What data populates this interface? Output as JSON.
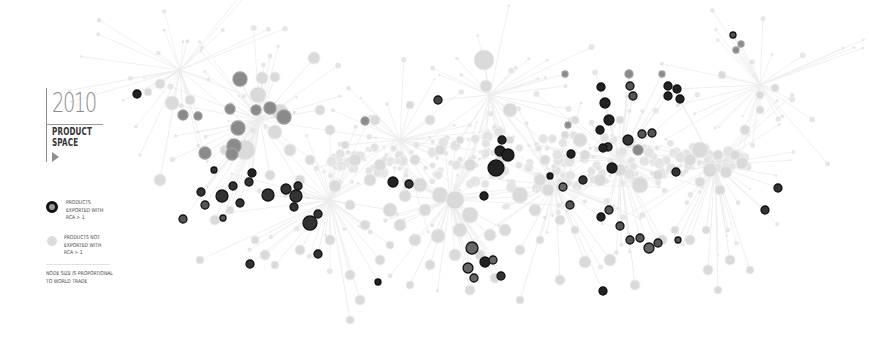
{
  "legend": {
    "year": "2010",
    "title_line1": "PRODUCT",
    "title_line2": "SPACE",
    "play_icon": "play-icon",
    "items": [
      {
        "label": "PRODUCTS\nEXPORTED WITH\nRCA > 1",
        "style": "rca"
      },
      {
        "label": "PRODUCTS NOT\nEXPORTED WITH\nRCA > 1",
        "style": "not-rca"
      }
    ],
    "footnote": "NODE SIZE IS PROPORTIONAL\nTO WORLD TRADE"
  },
  "colors": {
    "background": "#ffffff",
    "edge": "#ececec",
    "node_not_rca": "#dadada",
    "node_rca_dark": "#222222",
    "node_rca_mid": "#555555",
    "node_rca_light": "#8a8a8a"
  },
  "network": {
    "hubs": [
      [
        260,
        120
      ],
      [
        330,
        200
      ],
      [
        450,
        200
      ],
      [
        555,
        185
      ],
      [
        620,
        160
      ],
      [
        715,
        165
      ],
      [
        760,
        85
      ],
      [
        490,
        95
      ],
      [
        180,
        70
      ],
      [
        400,
        140
      ]
    ],
    "nodes_not_rca": [
      [
        484,
        60,
        10
      ],
      [
        486,
        86,
        6
      ],
      [
        510,
        110,
        7
      ],
      [
        314,
        58,
        6
      ],
      [
        240,
        80,
        7
      ],
      [
        262,
        78,
        6
      ],
      [
        275,
        77,
        5
      ],
      [
        258,
        95,
        8
      ],
      [
        280,
        112,
        8
      ],
      [
        245,
        150,
        10
      ],
      [
        275,
        132,
        7
      ],
      [
        290,
        150,
        6
      ],
      [
        172,
        103,
        7
      ],
      [
        160,
        84,
        5
      ],
      [
        148,
        92,
        4
      ],
      [
        160,
        180,
        6
      ],
      [
        190,
        100,
        5
      ],
      [
        225,
        150,
        5
      ],
      [
        270,
        175,
        5
      ],
      [
        300,
        180,
        5
      ],
      [
        335,
        186,
        6
      ],
      [
        355,
        160,
        6
      ],
      [
        375,
        120,
        5
      ],
      [
        380,
        165,
        6
      ],
      [
        390,
        210,
        7
      ],
      [
        405,
        196,
        6
      ],
      [
        420,
        185,
        7
      ],
      [
        425,
        210,
        6
      ],
      [
        440,
        195,
        8
      ],
      [
        455,
        200,
        9
      ],
      [
        470,
        215,
        8
      ],
      [
        460,
        230,
        7
      ],
      [
        438,
        236,
        7
      ],
      [
        415,
        240,
        6
      ],
      [
        400,
        225,
        6
      ],
      [
        365,
        225,
        5
      ],
      [
        350,
        205,
        5
      ],
      [
        520,
        195,
        8
      ],
      [
        540,
        180,
        6
      ],
      [
        548,
        190,
        6
      ],
      [
        535,
        210,
        6
      ],
      [
        505,
        230,
        6
      ],
      [
        520,
        250,
        5
      ],
      [
        490,
        235,
        6
      ],
      [
        480,
        255,
        5
      ],
      [
        545,
        160,
        5
      ],
      [
        580,
        140,
        7
      ],
      [
        600,
        180,
        6
      ],
      [
        620,
        170,
        6
      ],
      [
        640,
        185,
        8
      ],
      [
        658,
        175,
        5
      ],
      [
        690,
        160,
        6
      ],
      [
        700,
        150,
        8
      ],
      [
        710,
        170,
        7
      ],
      [
        718,
        155,
        5
      ],
      [
        726,
        172,
        6
      ],
      [
        735,
        155,
        5
      ],
      [
        742,
        163,
        6
      ],
      [
        700,
        182,
        5
      ],
      [
        720,
        190,
        5
      ],
      [
        610,
        260,
        6
      ],
      [
        635,
        285,
        5
      ],
      [
        662,
        240,
        5
      ],
      [
        675,
        230,
        4
      ],
      [
        690,
        240,
        5
      ],
      [
        706,
        230,
        4
      ],
      [
        730,
        260,
        5
      ],
      [
        750,
        270,
        4
      ],
      [
        708,
        270,
        5
      ],
      [
        718,
        290,
        4
      ],
      [
        760,
        95,
        4
      ],
      [
        775,
        88,
        4
      ],
      [
        745,
        130,
        5
      ],
      [
        760,
        110,
        4
      ],
      [
        722,
        75,
        4
      ],
      [
        300,
        250,
        5
      ],
      [
        330,
        240,
        5
      ],
      [
        350,
        275,
        5
      ],
      [
        380,
        260,
        5
      ],
      [
        410,
        285,
        4
      ],
      [
        430,
        265,
        5
      ],
      [
        455,
        255,
        6
      ],
      [
        470,
        290,
        5
      ],
      [
        495,
        278,
        5
      ],
      [
        520,
        300,
        4
      ],
      [
        560,
        280,
        5
      ],
      [
        585,
        262,
        6
      ],
      [
        200,
        260,
        4
      ],
      [
        215,
        220,
        5
      ],
      [
        230,
        210,
        4
      ],
      [
        255,
        240,
        4
      ],
      [
        265,
        255,
        5
      ],
      [
        275,
        265,
        4
      ],
      [
        575,
        120,
        4
      ],
      [
        565,
        135,
        4
      ],
      [
        585,
        155,
        5
      ],
      [
        620,
        120,
        4
      ],
      [
        600,
        130,
        4
      ],
      [
        415,
        160,
        5
      ],
      [
        440,
        150,
        5
      ],
      [
        460,
        140,
        4
      ],
      [
        470,
        165,
        6
      ],
      [
        500,
        160,
        5
      ],
      [
        510,
        140,
        4
      ],
      [
        430,
        120,
        5
      ],
      [
        410,
        105,
        4
      ],
      [
        320,
        110,
        5
      ],
      [
        330,
        130,
        5
      ],
      [
        345,
        145,
        4
      ],
      [
        310,
        160,
        5
      ],
      [
        370,
        180,
        6
      ],
      [
        390,
        245,
        4
      ],
      [
        360,
        300,
        5
      ],
      [
        350,
        320,
        4
      ],
      [
        540,
        240,
        4
      ],
      [
        560,
        220,
        5
      ],
      [
        575,
        230,
        4
      ]
    ],
    "nodes_rca": [
      [
        137,
        94,
        4,
        "#222"
      ],
      [
        240,
        79,
        7,
        "#8a8a8a"
      ],
      [
        256,
        110,
        5,
        "#8a8a8a"
      ],
      [
        270,
        108,
        6,
        "#8a8a8a"
      ],
      [
        284,
        117,
        7,
        "#8a8a8a"
      ],
      [
        238,
        128,
        7,
        "#8a8a8a"
      ],
      [
        234,
        146,
        7,
        "#8a8a8a"
      ],
      [
        205,
        153,
        6,
        "#8a8a8a"
      ],
      [
        230,
        109,
        5,
        "#8a8a8a"
      ],
      [
        183,
        115,
        5,
        "#8a8a8a"
      ],
      [
        198,
        116,
        4,
        "#8a8a8a"
      ],
      [
        232,
        154,
        6,
        "#8a8a8a"
      ],
      [
        214,
        170,
        3,
        "#333"
      ],
      [
        252,
        173,
        4,
        "#222"
      ],
      [
        249,
        182,
        4,
        "#333"
      ],
      [
        222,
        196,
        6,
        "#333"
      ],
      [
        201,
        192,
        4,
        "#333"
      ],
      [
        233,
        186,
        4,
        "#333"
      ],
      [
        268,
        195,
        6,
        "#333"
      ],
      [
        240,
        203,
        4,
        "#333"
      ],
      [
        286,
        189,
        5,
        "#333"
      ],
      [
        298,
        186,
        4,
        "#333"
      ],
      [
        296,
        196,
        6,
        "#333"
      ],
      [
        294,
        207,
        4,
        "#333"
      ],
      [
        310,
        223,
        7,
        "#333"
      ],
      [
        205,
        205,
        4,
        "#555"
      ],
      [
        223,
        218,
        3,
        "#555"
      ],
      [
        318,
        214,
        4,
        "#333"
      ],
      [
        318,
        254,
        4,
        "#333"
      ],
      [
        250,
        264,
        4,
        "#333"
      ],
      [
        183,
        219,
        4,
        "#555"
      ],
      [
        438,
        100,
        4,
        "#444"
      ],
      [
        409,
        184,
        4,
        "#333"
      ],
      [
        393,
        182,
        5,
        "#222"
      ],
      [
        365,
        121,
        4,
        "#8a8a8a"
      ],
      [
        502,
        140,
        4,
        "#222"
      ],
      [
        500,
        151,
        5,
        "#222"
      ],
      [
        508,
        155,
        6,
        "#222"
      ],
      [
        496,
        168,
        8,
        "#222"
      ],
      [
        484,
        196,
        4,
        "#222"
      ],
      [
        378,
        282,
        3,
        "#222"
      ],
      [
        472,
        248,
        6,
        "#666"
      ],
      [
        468,
        268,
        5,
        "#666"
      ],
      [
        485,
        262,
        5,
        "#222"
      ],
      [
        493,
        260,
        4,
        "#666"
      ],
      [
        474,
        278,
        4,
        "#666"
      ],
      [
        501,
        276,
        4,
        "#333"
      ],
      [
        565,
        74,
        3,
        "#8a8a8a"
      ],
      [
        601,
        87,
        4,
        "#222"
      ],
      [
        605,
        103,
        5,
        "#222"
      ],
      [
        609,
        120,
        5,
        "#222"
      ],
      [
        629,
        74,
        4,
        "#8a8a8a"
      ],
      [
        630,
        86,
        4,
        "#555"
      ],
      [
        633,
        96,
        4,
        "#555"
      ],
      [
        600,
        130,
        4,
        "#222"
      ],
      [
        568,
        125,
        3,
        "#8a8a8a"
      ],
      [
        628,
        140,
        5,
        "#333"
      ],
      [
        642,
        134,
        4,
        "#555"
      ],
      [
        652,
        133,
        4,
        "#555"
      ],
      [
        608,
        147,
        4,
        "#333"
      ],
      [
        571,
        154,
        4,
        "#222"
      ],
      [
        603,
        148,
        4,
        "#222"
      ],
      [
        612,
        168,
        5,
        "#222"
      ],
      [
        638,
        150,
        5,
        "#8a8a8a"
      ],
      [
        668,
        86,
        4,
        "#222"
      ],
      [
        677,
        89,
        4,
        "#222"
      ],
      [
        668,
        96,
        4,
        "#222"
      ],
      [
        680,
        99,
        4,
        "#222"
      ],
      [
        662,
        74,
        3,
        "#8a8a8a"
      ],
      [
        733,
        35,
        3,
        "#555"
      ],
      [
        741,
        44,
        3,
        "#8a8a8a"
      ],
      [
        736,
        50,
        3,
        "#8a8a8a"
      ],
      [
        583,
        180,
        4,
        "#333"
      ],
      [
        563,
        187,
        4,
        "#666"
      ],
      [
        550,
        176,
        3,
        "#222"
      ],
      [
        570,
        205,
        4,
        "#555"
      ],
      [
        601,
        217,
        4,
        "#222"
      ],
      [
        609,
        210,
        4,
        "#555"
      ],
      [
        620,
        226,
        4,
        "#555"
      ],
      [
        630,
        240,
        4,
        "#555"
      ],
      [
        640,
        238,
        4,
        "#555"
      ],
      [
        649,
        248,
        5,
        "#666"
      ],
      [
        658,
        243,
        4,
        "#555"
      ],
      [
        603,
        291,
        4,
        "#222"
      ],
      [
        676,
        172,
        4,
        "#333"
      ],
      [
        765,
        210,
        4,
        "#333"
      ],
      [
        778,
        188,
        4,
        "#333"
      ],
      [
        678,
        240,
        3,
        "#555"
      ]
    ],
    "edges_seed": 42
  }
}
